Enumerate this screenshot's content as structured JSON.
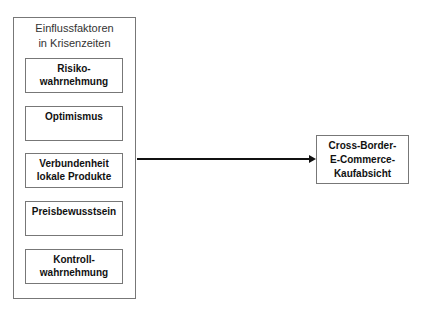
{
  "group": {
    "title_line1": "Einflussfaktoren",
    "title_line2": "in Krisenzeiten",
    "factors": [
      {
        "line1": "Risiko-",
        "line2": "wahrnehmung"
      },
      {
        "line1": "Optimismus",
        "line2": ""
      },
      {
        "line1": "Verbundenheit",
        "line2": "lokale Produkte"
      },
      {
        "line1": "Preisbewusstsein",
        "line2": ""
      },
      {
        "line1": "Kontroll-",
        "line2": "wahrnehmung"
      }
    ]
  },
  "target": {
    "line1": "Cross-Border-",
    "line2": "E-Commerce-",
    "line3": "Kaufabsicht"
  }
}
